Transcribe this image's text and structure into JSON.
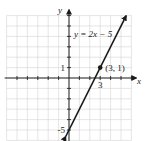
{
  "chart_data": {
    "type": "line",
    "title": "",
    "xlabel": "x",
    "ylabel": "y",
    "xlim": [
      -6,
      6
    ],
    "ylim": [
      -6,
      6
    ],
    "grid": true,
    "grid_step": 1,
    "series": [
      {
        "name": "y = 2x − 5",
        "equation_label": "y = 2x − 5",
        "slope": 2,
        "intercept": -5,
        "x_range": [
          -0.3,
          5.5
        ],
        "arrows": "both"
      }
    ],
    "points": [
      {
        "x": 3,
        "y": 1,
        "label": "(3, 1)"
      }
    ],
    "tick_labels": {
      "x": [
        {
          "value": 3,
          "label": "3"
        }
      ],
      "y": [
        {
          "value": 1,
          "label": "1"
        },
        {
          "value": -5,
          "label": "-5"
        }
      ]
    },
    "colors": {
      "line": "#1a1a1a",
      "grid": "#d4d4d4",
      "axis": "#222222"
    }
  }
}
